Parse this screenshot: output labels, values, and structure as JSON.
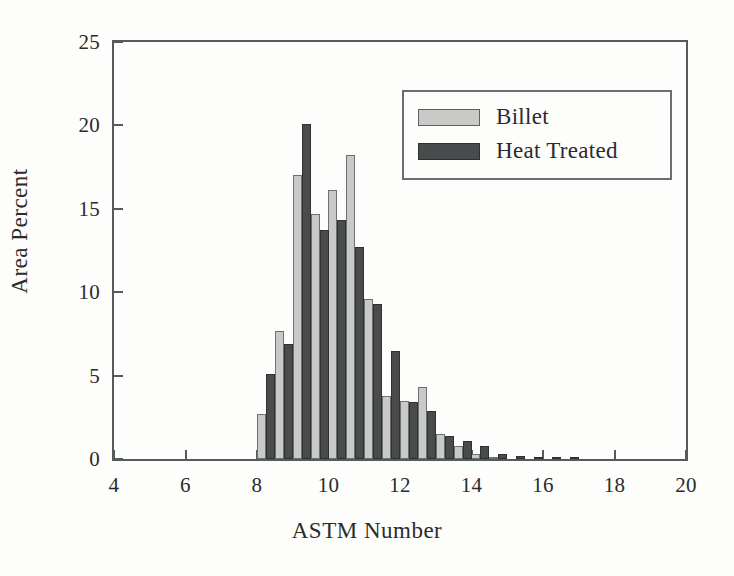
{
  "chart_data": {
    "type": "bar",
    "title": "",
    "xlabel": "ASTM Number",
    "ylabel": "Area Percent",
    "xlim": [
      4,
      20
    ],
    "ylim": [
      0,
      25
    ],
    "xticks": [
      4,
      6,
      8,
      10,
      12,
      14,
      16,
      18,
      20
    ],
    "yticks": [
      0,
      5,
      10,
      15,
      20,
      25
    ],
    "xtick_labels": [
      "4",
      "6",
      "8",
      "10",
      "12",
      "14",
      "16",
      "18",
      "20"
    ],
    "ytick_labels": [
      "0",
      "5",
      "10",
      "15",
      "20",
      "25"
    ],
    "grid": false,
    "legend_position": "upper right",
    "bin_width": 0.5,
    "x": [
      8.25,
      8.75,
      9.25,
      9.75,
      10.25,
      10.75,
      11.25,
      11.75,
      12.25,
      12.75,
      13.25,
      13.75,
      14.25,
      14.75,
      15.25,
      15.75,
      16.25,
      16.75
    ],
    "series": [
      {
        "name": "Billet",
        "color": "#c9c9c7",
        "edge_color": "#6e7174",
        "values": [
          2.7,
          7.7,
          17.0,
          14.7,
          16.1,
          18.2,
          9.6,
          3.8,
          3.5,
          4.3,
          1.5,
          0.8,
          0.3,
          0.1,
          0.0,
          0.0,
          0.0,
          0.0
        ]
      },
      {
        "name": "Heat Treated",
        "color": "#494b4d",
        "edge_color": "#2e3032",
        "values": [
          5.1,
          6.9,
          20.1,
          13.7,
          14.3,
          12.7,
          9.3,
          6.5,
          3.4,
          2.9,
          1.4,
          1.1,
          0.8,
          0.3,
          0.2,
          0.1,
          0.1,
          0.1
        ]
      }
    ]
  },
  "legend": {
    "items": [
      {
        "label": "Billet",
        "swatch": "billet"
      },
      {
        "label": "Heat Treated",
        "swatch": "heat"
      }
    ]
  }
}
